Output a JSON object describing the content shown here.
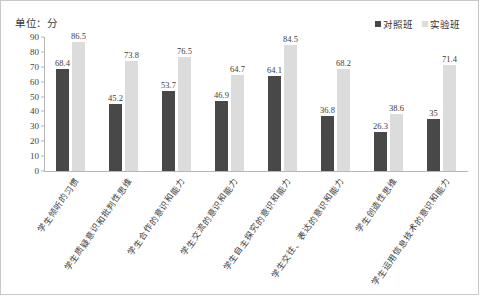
{
  "unit_caption": "单位：分",
  "legend": {
    "position": "top-right",
    "items": [
      {
        "label": "对照班",
        "color": "#484848"
      },
      {
        "label": "实验班",
        "color": "#dcdcdc"
      }
    ]
  },
  "chart_data": {
    "type": "bar",
    "title": "",
    "subtitle": "",
    "xlabel": "",
    "ylabel": "单位：分",
    "ylim": [
      0,
      90
    ],
    "yticks": [
      0,
      10,
      20,
      30,
      40,
      50,
      60,
      70,
      80,
      90
    ],
    "grid": false,
    "legend_position": "top-right",
    "categories": [
      "学生倾听的习惯",
      "学生质疑意识和批判性思维",
      "学生合作的意识和能力",
      "学生交流的意识和能力",
      "学生自主探究的意识和能力",
      "学生交往、表达的意识和能力",
      "学生创造性思维",
      "学生运用信息技术的意识和能力"
    ],
    "series": [
      {
        "name": "对照班",
        "color": "#484848",
        "values": [
          68.4,
          45.2,
          53.7,
          46.9,
          64.1,
          36.8,
          26.3,
          35
        ],
        "labels": [
          "68.4",
          "45.2",
          "53.7",
          "46.9",
          "64.1",
          "36.8",
          "26.3",
          "35"
        ]
      },
      {
        "name": "实验班",
        "color": "#dcdcdc",
        "values": [
          86.5,
          73.8,
          76.5,
          64.7,
          84.5,
          68.2,
          38.6,
          71.4
        ],
        "labels": [
          "86.5",
          "73.8",
          "76.5",
          "64.7",
          "84.5",
          "68.2",
          "38.6",
          "71.4"
        ]
      }
    ]
  }
}
